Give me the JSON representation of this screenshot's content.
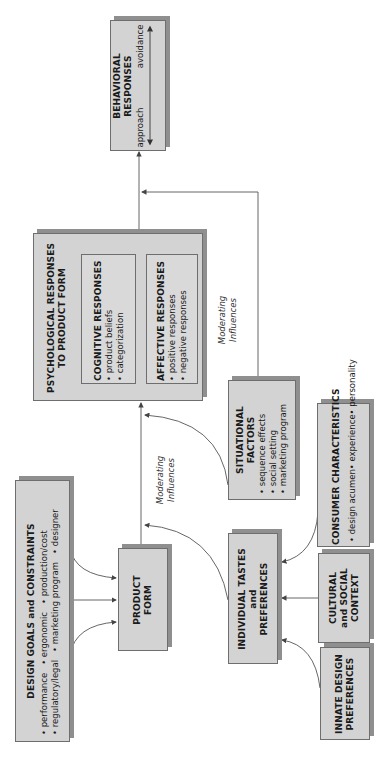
{
  "diagram": {
    "orientation": "rotated -90 degrees (reads bottom-to-top)",
    "nodes": {
      "behavioral_responses": {
        "title_line1": "BEHAVIORAL",
        "title_line2": "RESPONSES",
        "scale_left": "approach",
        "scale_right": "avoidance"
      },
      "psychological_responses": {
        "title_line1": "PSYCHOLOGICAL RESPONSES",
        "title_line2": "TO PRODUCT FORM",
        "cognitive": {
          "title": "COGNITIVE RESPONSES",
          "items": [
            "• product beliefs",
            "• categorization"
          ]
        },
        "affective": {
          "title": "AFFECTIVE RESPONSES",
          "items": [
            "• positive responses",
            "• negative responses"
          ]
        }
      },
      "situational_factors": {
        "title_line1": "SITUATIONAL",
        "title_line2": "FACTORS",
        "items": [
          "• sequence effects",
          "• social setting",
          "• marketing program"
        ]
      },
      "consumer_characteristics": {
        "title": "CONSUMER CHARACTERISTICS",
        "items": [
          "• design acumen",
          "• experience",
          "• personality"
        ]
      },
      "design_goals": {
        "title": "DESIGN GOALS and CONSTRAINTS",
        "row1": [
          "• performance",
          "• ergonomic",
          "• production/cost"
        ],
        "row2": [
          "• regulatory/legal",
          "• marketing program",
          "• designer"
        ]
      },
      "product_form": {
        "title_line1": "PRODUCT",
        "title_line2": "FORM"
      },
      "individual_tastes": {
        "title_line1": "INDIVIDUAL TASTES",
        "title_line2": "and",
        "title_line3": "PREFERENCES"
      },
      "cultural_context": {
        "title_line1": "CULTURAL",
        "title_line2": "and SOCIAL",
        "title_line3": "CONTEXT"
      },
      "innate_preferences": {
        "title_line1": "INNATE DESIGN",
        "title_line2": "PREFERENCES"
      }
    },
    "labels": {
      "moderating_1_line1": "Moderating",
      "moderating_1_line2": "Influences",
      "moderating_2_line1": "Moderating",
      "moderating_2_line2": "Influences"
    },
    "colors": {
      "box_fill": "#d3d3d3",
      "box_border": "#6e6e6e",
      "box_shadow": "#8f8f8f",
      "line": "#555555"
    }
  }
}
